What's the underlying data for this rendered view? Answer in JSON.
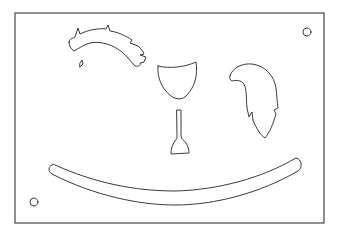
{
  "diagram": {
    "type": "cutout-template",
    "colors": {
      "background": "#ffffff",
      "line": "#3a3a3a",
      "board_edge": "#444444"
    },
    "board": {
      "x": 15,
      "y": 13,
      "width": 309,
      "height": 210
    },
    "pieces": [
      {
        "id": "mane",
        "label": "mane",
        "shape": "curved jagged strip"
      },
      {
        "id": "small-notch",
        "label": "small triangular cutout",
        "shape": "triangle"
      },
      {
        "id": "saddle",
        "label": "saddle/shield",
        "shape": "shield"
      },
      {
        "id": "peg",
        "label": "handle peg",
        "shape": "stem with flared base"
      },
      {
        "id": "tail",
        "label": "tail",
        "shape": "curved plume"
      },
      {
        "id": "rocker",
        "label": "rocker",
        "shape": "long arc"
      }
    ],
    "holes": [
      {
        "id": "hole-top-right",
        "cx": 307,
        "cy": 32,
        "r": 4
      },
      {
        "id": "hole-bottom-left",
        "cx": 34,
        "cy": 202,
        "r": 4
      }
    ]
  }
}
